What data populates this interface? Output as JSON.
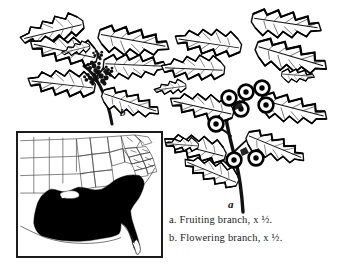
{
  "plate": {
    "title": "American holly botanical plate",
    "background_color": "#ffffff",
    "ink_color": "#111111"
  },
  "figures": [
    {
      "key": "b",
      "label": "b",
      "name": "flowering-branch",
      "description": "Flowering branch with spiny holly leaves and axillary flower bud clusters",
      "position": "upper-left"
    },
    {
      "key": "a",
      "label": "a",
      "name": "fruiting-branch",
      "description": "Fruiting branch with spiny holly leaves and round berries",
      "position": "right"
    }
  ],
  "caption": {
    "lines": [
      {
        "key": "a",
        "text": "a. Fruiting branch, x ½."
      },
      {
        "key": "b",
        "text": "b. Flowering branch, x ½."
      }
    ],
    "line_a": "a. Fruiting branch, x ½.",
    "line_b": "b. Flowering branch, x ½."
  },
  "map": {
    "name": "distribution-map",
    "region": "Eastern United States",
    "range_fill_color": "#000000",
    "outline_color": "#3a3a3a",
    "border_color": "#1b1b1b",
    "range_description": "Southeastern United States from eastern Texas through Florida north to Missouri, Kentucky, Virginia and coastal Massachusetts"
  }
}
